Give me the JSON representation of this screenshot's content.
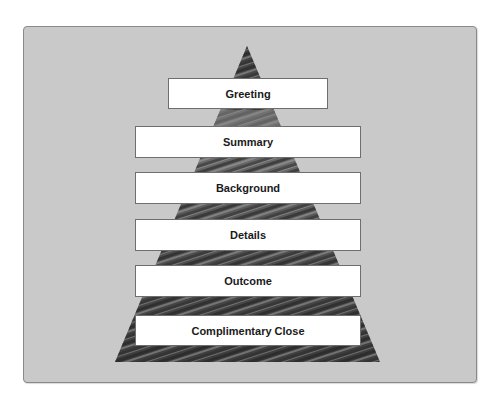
{
  "diagram": {
    "type": "pyramid",
    "levels": [
      {
        "label": "Greeting"
      },
      {
        "label": "Summary"
      },
      {
        "label": "Background"
      },
      {
        "label": "Details"
      },
      {
        "label": "Outcome"
      },
      {
        "label": "Complimentary Close"
      }
    ],
    "colors": {
      "panel_background": "#c9c9c9",
      "panel_border": "#8a8a8a",
      "pyramid_dark": "#2e2e2e",
      "pyramid_light": "#9a9a9a",
      "box_background": "#ffffff",
      "box_border": "#6e6e6e",
      "text": "#1a1a1a"
    }
  }
}
